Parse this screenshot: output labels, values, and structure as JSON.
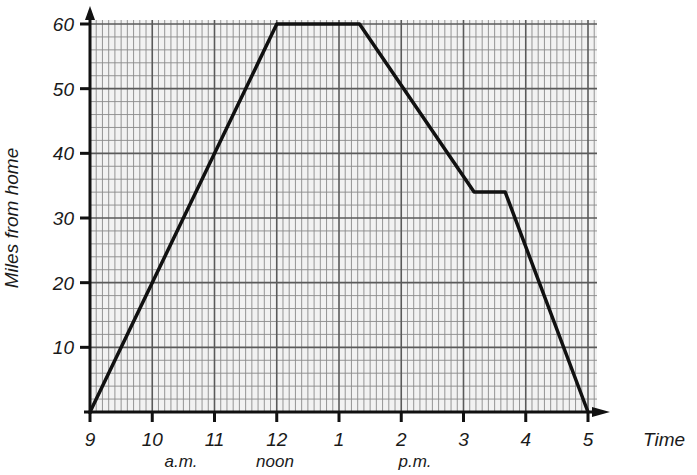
{
  "chart_data": {
    "type": "line",
    "title": "",
    "xlabel": "Time",
    "ylabel": "Miles from home",
    "x_tick_labels": [
      "9",
      "10",
      "11",
      "12",
      "1",
      "2",
      "3",
      "4",
      "5"
    ],
    "x_sublabels": [
      {
        "text": "a.m.",
        "at_hour": 10.5
      },
      {
        "text": "noon",
        "at_hour": 12
      },
      {
        "text": "p.m.",
        "at_hour": 14
      }
    ],
    "y_tick_labels": [
      "10",
      "20",
      "30",
      "40",
      "50",
      "60"
    ],
    "xlim_hours": [
      9,
      17
    ],
    "ylim": [
      0,
      60
    ],
    "grid": true,
    "legend": null,
    "series": [
      {
        "name": "Journey",
        "points": [
          {
            "time": "9:00 a.m.",
            "hour": 9.0,
            "miles": 0
          },
          {
            "time": "12:00 noon",
            "hour": 12.0,
            "miles": 60
          },
          {
            "time": "1:20 p.m.",
            "hour": 13.33,
            "miles": 60
          },
          {
            "time": "3:10 p.m.",
            "hour": 15.17,
            "miles": 34
          },
          {
            "time": "3:40 p.m.",
            "hour": 15.67,
            "miles": 34
          },
          {
            "time": "5:00 p.m.",
            "hour": 17.0,
            "miles": 0
          }
        ]
      }
    ]
  },
  "colors": {
    "grid_minor": "#8a8a8a",
    "grid_major": "#5a5a5a",
    "paper": "#f2f2f2",
    "line": "#111111",
    "axis": "#111111"
  }
}
